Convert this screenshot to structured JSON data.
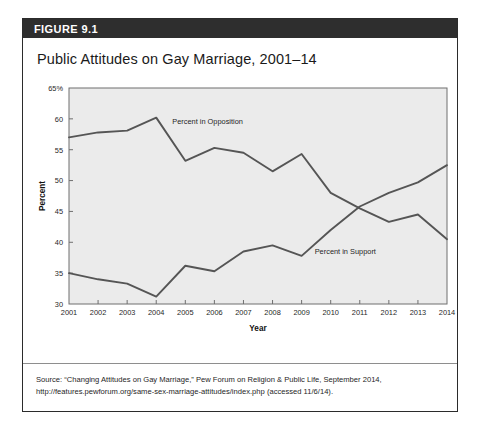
{
  "figure": {
    "number": "FIGURE 9.1",
    "title": "Public Attitudes on Gay Marriage, 2001–14"
  },
  "source": {
    "label": "Source:",
    "line1": " “Changing Attitudes on Gay Marriage,” Pew Forum on Religion & Public Life, September 2014,",
    "line2": "http://features.pewforum.org/same-sex-marriage-attitudes/index.php (accessed 11/6/14)."
  },
  "colors": {
    "header_bar": "#2e2e2e",
    "plot_background": "#ebebeb",
    "line": "#555555",
    "axis": "#6f6f6f",
    "card_border": "#2b2b2b"
  },
  "chart_data": {
    "type": "line",
    "title": "Public Attitudes on Gay Marriage, 2001–14",
    "xlabel": "Year",
    "ylabel": "Percent",
    "x": [
      2001,
      2002,
      2003,
      2004,
      2005,
      2006,
      2007,
      2008,
      2009,
      2010,
      2011,
      2012,
      2013,
      2014
    ],
    "xtick_labels": [
      "2001",
      "2002",
      "2003",
      "2004",
      "2005",
      "2006",
      "2007",
      "2008",
      "2009",
      "2010",
      "2011",
      "2012",
      "2013",
      "2014"
    ],
    "ytick_labels": [
      "30",
      "35",
      "40",
      "45",
      "50",
      "55",
      "60",
      "65%"
    ],
    "ytick_values": [
      30,
      35,
      40,
      45,
      50,
      55,
      60,
      65
    ],
    "ylim": [
      30,
      65
    ],
    "xlim": [
      2001,
      2014
    ],
    "grid": false,
    "legend": "inline-annotations",
    "series": [
      {
        "name": "Percent in Opposition",
        "label_x": 2004.55,
        "label_y": 59.2,
        "values": [
          57.0,
          57.8,
          58.1,
          60.2,
          53.2,
          55.3,
          54.5,
          51.5,
          54.3,
          48.0,
          45.5,
          43.3,
          44.5,
          40.5
        ]
      },
      {
        "name": "Percent in Support",
        "label_x": 2009.45,
        "label_y": 38.1,
        "values": [
          35.0,
          34.0,
          33.3,
          31.2,
          36.2,
          35.3,
          38.5,
          39.5,
          37.8,
          42.0,
          45.8,
          48.0,
          49.7,
          52.5
        ]
      }
    ]
  }
}
